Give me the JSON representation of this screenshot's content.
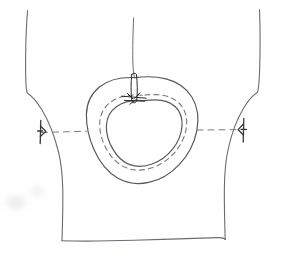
{
  "document": {
    "kind": "hand-drawn-sketch",
    "medium": "pencil on white paper",
    "subject": "garment bodice pattern piece with neckline opening",
    "visible_text": "",
    "has_labels": false,
    "has_numbers": false
  },
  "canvas": {
    "width": 284,
    "height": 263,
    "paper_color": "#ffffff",
    "ink_color": "#555158",
    "ink_color_light": "#8d8a92",
    "ink_color_dark": "#2b272d",
    "smudge_color": "#ded9dd"
  },
  "strokes": {
    "left_side_seam": {
      "name": "left-side-seam",
      "description": "near-vertical edge from top that flares outward toward hem",
      "stroke": "#6e6a72",
      "width": 1.1,
      "path": "M 27.5 10.5 C 26.2 28 25.4 50 25.6 72 C 25.7 84 26.2 90.5 27.4 93.2 C 31.5 95.5 36.5 101 42 110 C 49 121.5 54.5 136 58.5 152 C 61.2 163 62.5 176 62.8 190 C 63.0 205 62.6 222 62.0 240.5"
    },
    "right_side_seam": {
      "name": "right-side-seam",
      "description": "near-vertical edge mirroring the left, flaring outward toward hem",
      "stroke": "#6e6a72",
      "width": 1.1,
      "path": "M 259.5 9.5 C 260.2 27 260.3 49 259.6 70 C 259.2 82 258.6 89.5 257.4 92.6 C 253.0 95.0 248.2 100.5 243.4 108.5 C 236.8 119.5 231.8 133 228.4 148 C 225.8 159.5 224.6 173 224.4 187 C 224.2 202 224.6 220 225.2 239.5"
    },
    "hem_line": {
      "name": "hem-line",
      "description": "slightly irregular horizontal bottom edge",
      "stroke": "#6e6a72",
      "width": 1.1,
      "path": "M 61.8 240.8 C 83 241.4 108 241.1 134 240.3 C 162 239.4 192 238.4 218 237.6 C 221 237.5 223.4 237.4 225.4 239.3"
    },
    "center_front_line": {
      "name": "center-front-line",
      "description": "vertical construction line from top edge down into neckline",
      "stroke": "#6e6a72",
      "width": 1.0,
      "path": "M 133.6 18.0 C 133.0 33 132.6 48 132.8 60 C 133.0 68 133.4 73.5 134.6 78.0"
    },
    "neckline_outer": {
      "name": "neckline-outer-contour",
      "description": "outer solid hand-drawn oval of the neck opening",
      "stroke": "#5b575e",
      "width": 1.2,
      "path": "M 134.8 77.6 C 120 77.0 108 80.0 99.4 87.0 C 91.0 93.8 86.6 103.5 86.4 114.5 C 86.2 126 89.0 138.5 94.2 150.0 C 99.8 162.5 108.0 172.5 117.6 178.0 C 127.0 183.4 137.8 184.8 148.8 182.4 C 160.0 180.0 170.6 173.8 179.2 164.6 C 188.2 155.0 194.4 143.0 196.8 130.8 C 199.2 118.4 197.6 106.4 192.0 97.2 C 186.4 88.0 177.2 81.6 166.0 78.8 C 156.6 76.5 145.8 76.2 134.8 77.6 Z"
    },
    "neckline_stitch_dashed": {
      "name": "neckline-dashed-stitch-line",
      "description": "dashed seam/stitch guideline between outer and inner neckline contours",
      "stroke": "#7a767e",
      "width": 1.1,
      "dash": "5 4",
      "path": "M 142.4 95.2 C 130.0 94.2 119.6 96.2 112.0 101.2 C 104.6 106.0 100.4 113.4 99.8 122.2 C 99.2 131.0 101.8 140.6 106.4 149.0 C 111.2 157.8 118.2 164.6 126.2 167.8 C 134.2 171.0 143.2 170.8 152.0 167.8 C 161.0 164.8 169.4 159.0 175.6 151.4 C 182.0 143.6 185.8 134.4 186.6 125.6 C 187.4 116.4 184.6 108.4 179.0 103.0 C 173.4 97.6 165.0 94.8 155.6 94.6 C 151.2 94.5 146.8 94.7 142.4 95.2 Z"
    },
    "neckline_inner": {
      "name": "neckline-inner-contour",
      "description": "inner solid oval of the neck opening (finished edge)",
      "stroke": "#5b575e",
      "width": 1.2,
      "path": "M 143.6 100.6 C 132.6 99.8 123.4 101.8 116.8 106.4 C 110.4 110.8 106.8 117.4 106.4 125.2 C 106.0 133.0 108.4 141.4 112.6 148.6 C 116.8 156.2 122.8 162.0 129.8 164.6 C 136.8 167.2 144.6 166.8 152.2 164.0 C 160.0 161.2 167.2 156.0 172.6 149.2 C 178.2 142.2 181.4 134.0 182.0 126.2 C 182.6 118.2 180.2 111.4 175.4 106.8 C 170.6 102.2 163.4 99.8 155.2 99.8 C 151.4 99.8 147.4 100.1 143.6 100.6 Z"
    },
    "bust_guideline_left": {
      "name": "bust-guideline-dashed-left",
      "description": "dashed horizontal balance line from left notch to neckline",
      "stroke": "#7d7981",
      "width": 1.0,
      "dash": "6 5",
      "path": "M 41.5 132.5 L 86.4 131.2"
    },
    "bust_guideline_right": {
      "name": "bust-guideline-dashed-right",
      "description": "dashed horizontal balance line from neckline to right notch",
      "stroke": "#7d7981",
      "width": 1.0,
      "dash": "6 5",
      "path": "M 197.0 130.0 L 243.0 129.6"
    },
    "notch_left": {
      "name": "notch-mark-left",
      "description": "small dark notch/tick mark on the left seam at the balance line",
      "stroke": "#3a363c",
      "width": 1.3,
      "paths": [
        "M 40.8 120.5 L 40.2 143.5",
        "M 40.4 126.0 L 45.6 131.0",
        "M 40.4 136.5 L 45.8 131.4",
        "M 37.6 131.0 L 42.6 131.0"
      ]
    },
    "notch_right": {
      "name": "notch-mark-right",
      "description": "small dark notch/tick mark on the right seam at the balance line",
      "stroke": "#3a363c",
      "width": 1.3,
      "paths": [
        "M 243.8 118.5 L 243.2 142.0",
        "M 243.4 124.0 L 238.4 129.4",
        "M 243.4 135.0 L 238.2 129.8",
        "M 246.4 129.4 L 241.2 129.4"
      ]
    },
    "center_notch_marker": {
      "name": "center-front-notch-marker",
      "description": "dark filled tab/notch where the center front line meets the neckline",
      "fill": "#2b272d",
      "stroke": "#2b272d",
      "width": 1.0,
      "body_path": "M 131.8 74.5 C 132.8 73.0 135.4 72.8 136.4 74.2 C 137.4 82.5 137.6 92.5 136.8 100.5 C 136.0 103.5 132.6 103.6 131.8 100.8 C 130.8 92.5 130.8 82.5 131.8 74.5 Z",
      "tick_paths": [
        "M 122.0 96.2 L 146.2 98.2",
        "M 124.4 100.4 L 144.6 101.2",
        "M 127.4 93.4 L 133.0 99.0",
        "M 140.0 92.8 L 134.2 98.6",
        "M 129.8 104.2 L 136.2 99.6"
      ]
    }
  },
  "smudges": [
    {
      "name": "smudge-left-lower",
      "x": 6,
      "y": 196,
      "w": 20,
      "h": 13,
      "opacity": 0.5
    },
    {
      "name": "smudge-left-mid",
      "x": 30,
      "y": 186,
      "w": 14,
      "h": 10,
      "opacity": 0.35
    }
  ]
}
